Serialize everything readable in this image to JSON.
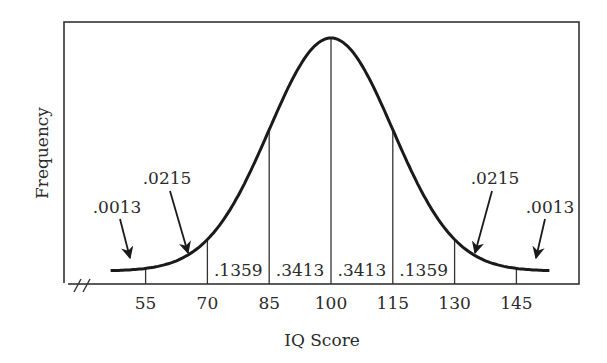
{
  "chart_data": {
    "type": "area",
    "title": "",
    "xlabel": "IQ Score",
    "ylabel": "Frequency",
    "distribution": {
      "name": "normal",
      "mean": 100,
      "sd": 15
    },
    "x_ticks": [
      55,
      70,
      85,
      100,
      115,
      130,
      145
    ],
    "tick_labels": [
      "55",
      "70",
      "85",
      "100",
      "115",
      "130",
      "145"
    ],
    "xlim": [
      44,
      155
    ],
    "axis_break": true,
    "grid": false,
    "legend": null,
    "regions": [
      {
        "from": null,
        "to": 55,
        "proportion": 0.0013,
        "label": ".0013",
        "arrow": true
      },
      {
        "from": 55,
        "to": 70,
        "proportion": 0.0215,
        "label": ".0215",
        "arrow": true
      },
      {
        "from": 70,
        "to": 85,
        "proportion": 0.1359,
        "label": ".1359",
        "arrow": false
      },
      {
        "from": 85,
        "to": 100,
        "proportion": 0.3413,
        "label": ".3413",
        "arrow": false
      },
      {
        "from": 100,
        "to": 115,
        "proportion": 0.3413,
        "label": ".3413",
        "arrow": false
      },
      {
        "from": 115,
        "to": 130,
        "proportion": 0.1359,
        "label": ".1359",
        "arrow": false
      },
      {
        "from": 130,
        "to": 145,
        "proportion": 0.0215,
        "label": ".0215",
        "arrow": true
      },
      {
        "from": 145,
        "to": null,
        "proportion": 0.0013,
        "label": ".0013",
        "arrow": true
      }
    ]
  },
  "colors": {
    "ink": "#1a1a1a",
    "frame": "#333333",
    "background": "#ffffff"
  }
}
